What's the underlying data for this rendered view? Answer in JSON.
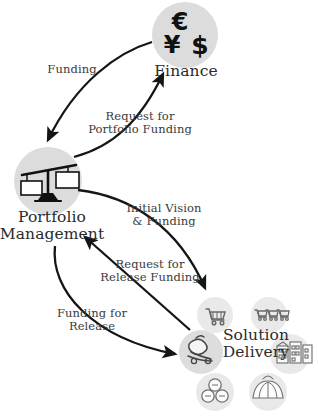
{
  "diagram": {
    "background_color": "#ffffff",
    "node_fill_color": "#dcdcdc",
    "satellite_fill_color": "#e8e8e8",
    "stroke_color": "#1a1a1a",
    "text_color": "#2b2b2b"
  },
  "nodes": [
    {
      "id": "finance",
      "label": "Finance",
      "icon": "currency-symbols-icon",
      "icon_glyphs": [
        "€",
        "¥",
        "$"
      ],
      "cx": 185,
      "cy": 35,
      "r": 33
    },
    {
      "id": "portfolio-management",
      "label": "Portfolio\nManagement",
      "icon": "balance-scale-icon",
      "cx": 48,
      "cy": 181,
      "r": 34
    },
    {
      "id": "solution-delivery",
      "label": "Solution\nDelivery",
      "icon": "delivery-trolley-icon",
      "cx": 201,
      "cy": 352,
      "r": 22
    }
  ],
  "satellites": [
    {
      "id": "shopping-cart-single",
      "icon": "shopping-cart-icon",
      "cx": 215,
      "cy": 315,
      "r": 18
    },
    {
      "id": "shopping-carts-row",
      "icon": "shopping-carts-row-icon",
      "cx": 269,
      "cy": 315,
      "r": 18
    },
    {
      "id": "buildings",
      "icon": "buildings-icon",
      "cx": 290,
      "cy": 354,
      "r": 20
    },
    {
      "id": "process-circles",
      "icon": "process-circles-icon",
      "cx": 215,
      "cy": 392,
      "r": 19
    },
    {
      "id": "dome-fan",
      "icon": "dome-fan-icon",
      "cx": 268,
      "cy": 392,
      "r": 19
    }
  ],
  "edges": [
    {
      "id": "finance-to-portfolio",
      "label": "Funding",
      "from": "finance",
      "to": "portfolio-management"
    },
    {
      "id": "portfolio-to-finance",
      "label": "Request for\nPortfolio Funding",
      "from": "portfolio-management",
      "to": "finance"
    },
    {
      "id": "portfolio-to-solution",
      "label": "Initial Vision\n& Funding",
      "from": "portfolio-management",
      "to": "solution-delivery"
    },
    {
      "id": "solution-to-portfolio-request",
      "label": "Request for\nRelease Funding",
      "from": "solution-delivery",
      "to": "portfolio-management"
    },
    {
      "id": "portfolio-to-solution-release",
      "label": "Funding for\nRelease",
      "from": "portfolio-management",
      "to": "solution-delivery"
    }
  ]
}
